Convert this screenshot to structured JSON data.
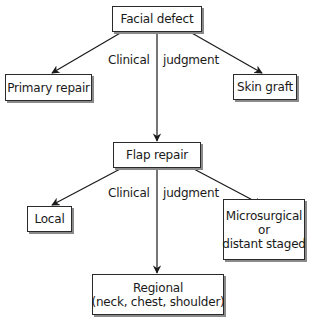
{
  "diagram": {
    "type": "flowchart",
    "nodes": {
      "facial_defect": {
        "lines": [
          "Facial defect"
        ]
      },
      "primary_repair": {
        "lines": [
          "Primary repair"
        ]
      },
      "skin_graft": {
        "lines": [
          "Skin graft"
        ]
      },
      "flap_repair": {
        "lines": [
          "Flap repair"
        ]
      },
      "local": {
        "lines": [
          "Local"
        ]
      },
      "microsurgical": {
        "lines": [
          "Microsurgical",
          "or",
          "distant staged"
        ]
      },
      "regional": {
        "lines": [
          "Regional",
          "(neck, chest, shoulder)"
        ]
      }
    },
    "edge_labels": {
      "top": {
        "left": "Clinical",
        "right": "judgment"
      },
      "bottom": {
        "left": "Clinical",
        "right": "judgment"
      }
    },
    "edges": [
      {
        "from": "Facial defect",
        "to": "Primary repair"
      },
      {
        "from": "Facial defect",
        "to": "Skin graft"
      },
      {
        "from": "Facial defect",
        "to": "Flap repair"
      },
      {
        "from": "Flap repair",
        "to": "Local"
      },
      {
        "from": "Flap repair",
        "to": "Microsurgical or distant staged"
      },
      {
        "from": "Flap repair",
        "to": "Regional (neck, chest, shoulder)"
      }
    ],
    "colors": {
      "line": "#1a1a1a",
      "box_border": "#2a2a2a",
      "box_shadow": "#8a8a8a",
      "background": "#ffffff"
    }
  }
}
